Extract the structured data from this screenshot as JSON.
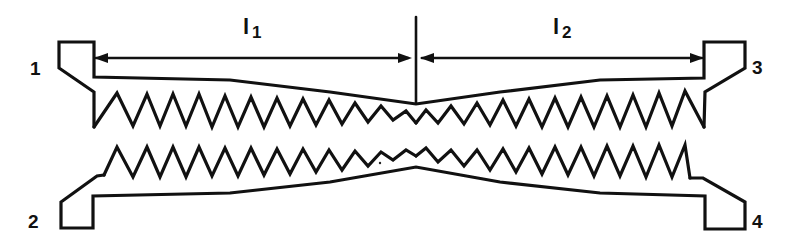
{
  "diagram": {
    "type": "tapered coupled-line (interdigitated sawtooth) directional coupler schematic",
    "ports": [
      {
        "id": "port-1",
        "label": "1",
        "x": 38,
        "y": 68
      },
      {
        "id": "port-2",
        "label": "2",
        "x": 36,
        "y": 222
      },
      {
        "id": "port-3",
        "label": "3",
        "x": 756,
        "y": 67
      },
      {
        "id": "port-4",
        "label": "4",
        "x": 756,
        "y": 222
      }
    ],
    "dimensions": [
      {
        "id": "l1",
        "label": "l",
        "subscript": "1",
        "x": 247,
        "y": 33
      },
      {
        "id": "l2",
        "label": "l",
        "subscript": "2",
        "x": 555,
        "y": 33
      }
    ],
    "stroke_color": "#111111",
    "background": "#ffffff"
  }
}
